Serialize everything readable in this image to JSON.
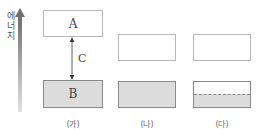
{
  "axis": {
    "label": "에너지",
    "arrow_icon": "energy-up-arrow-icon"
  },
  "panels": [
    {
      "id": "ga",
      "label": "(가)",
      "upper_box": {
        "label": "A",
        "fill": "white"
      },
      "lower_box": {
        "label": "B",
        "fill": "gray"
      },
      "gap_label": "C"
    },
    {
      "id": "na",
      "label": "(나)",
      "upper_box": {
        "label": "",
        "fill": "white"
      },
      "lower_box": {
        "label": "",
        "fill": "gray"
      }
    },
    {
      "id": "da",
      "label": "(다)",
      "upper_box": {
        "label": "",
        "fill": "white"
      },
      "lower_box": {
        "label": "",
        "fill": "half-gray-dashed"
      }
    }
  ],
  "colors": {
    "box_border": "#b8b8b8",
    "filled_box": "#dcdcdc",
    "arrow_gradient_top": "#6e6e6e",
    "arrow_gradient_bottom": "#e0e0e0"
  }
}
